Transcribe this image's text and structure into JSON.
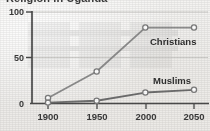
{
  "title": "Religion in Uganda",
  "colors": {
    "paper": "#f1f0ee",
    "axis": "#4a4a4a",
    "grid": "#c9c8c5",
    "line": "#8d8d8d",
    "line_dark": "#6e6e6e",
    "marker_fill": "#ffffff",
    "marker_stroke": "#7d7d7d",
    "text": "#3a3a3a"
  },
  "axes": {
    "y_ticks": [
      "0",
      "50",
      "100"
    ],
    "x_ticks": [
      "1900",
      "1950",
      "2000",
      "2050"
    ]
  },
  "labels": {
    "christians": "Christians",
    "muslims": "Muslims"
  },
  "chart_data": {
    "type": "line",
    "title": "Religion in Uganda",
    "xlabel": "",
    "ylabel": "",
    "x": [
      1900,
      1950,
      2000,
      2050
    ],
    "xlim": [
      1890,
      2062
    ],
    "ylim": [
      0,
      100
    ],
    "ytick_values": [
      0,
      50,
      100
    ],
    "grid": true,
    "legend": "inline-labels",
    "series": [
      {
        "name": "Christians",
        "values": [
          6,
          35,
          83,
          83
        ]
      },
      {
        "name": "Muslims",
        "values": [
          1,
          3,
          12,
          15
        ]
      }
    ]
  }
}
